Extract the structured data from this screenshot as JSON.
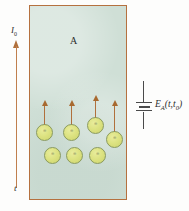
{
  "figure": {
    "region": {
      "label": "A",
      "fill_color": "#cfdfd6",
      "border_color": "#b5713f"
    },
    "current_arrow": {
      "top_label": "I",
      "top_label_sub": "0",
      "bottom_label": "t",
      "direction": "up",
      "color": "#b0703c"
    },
    "emf_source": {
      "label": "E",
      "label_sub": "A",
      "label_args": "(t,t",
      "label_args_sub": "0",
      "label_close": ")",
      "symbol": "battery-cell",
      "color": "#4a4a4a"
    },
    "particles": [
      {
        "x": 36,
        "y": 124,
        "arrow": true,
        "arrow_top": 100,
        "mark": "⊕"
      },
      {
        "x": 63,
        "y": 124,
        "arrow": true,
        "arrow_top": 100,
        "mark": "⊕"
      },
      {
        "x": 87,
        "y": 117,
        "arrow": true,
        "arrow_top": 95,
        "mark": "⊕"
      },
      {
        "x": 106,
        "y": 131,
        "arrow": true,
        "arrow_top": 100,
        "mark": "⊕"
      },
      {
        "x": 44,
        "y": 147,
        "arrow": false,
        "arrow_top": 0,
        "mark": "⊕"
      },
      {
        "x": 66,
        "y": 147,
        "arrow": false,
        "arrow_top": 0,
        "mark": "⊕"
      },
      {
        "x": 89,
        "y": 147,
        "arrow": false,
        "arrow_top": 0,
        "mark": "⊕"
      }
    ]
  }
}
